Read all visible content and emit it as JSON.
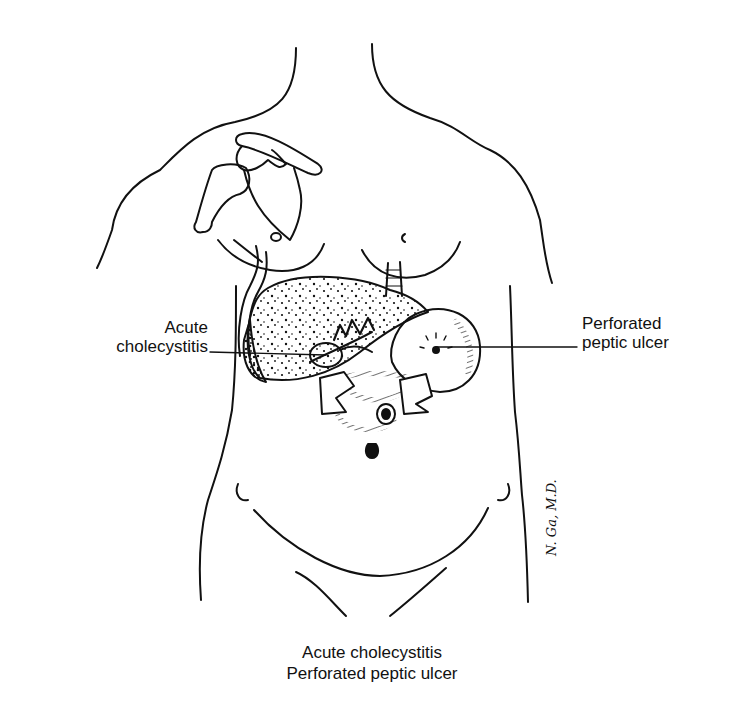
{
  "figure": {
    "stroke_color": "#111111",
    "background_color": "#ffffff",
    "organs": [
      "liver",
      "gallbladder",
      "stomach",
      "duodenum",
      "pancreas",
      "esophagus",
      "hepatic duct"
    ]
  },
  "labels": {
    "left": {
      "line1": "Acute",
      "line2": "cholecystitis",
      "points_to": "gallbladder"
    },
    "right": {
      "line1": "Perforated",
      "line2": "peptic ulcer",
      "points_to": "stomach ulcer site"
    }
  },
  "caption": {
    "line1": "Acute cholecystitis",
    "line2": "Perforated peptic ulcer"
  },
  "signature": {
    "text": "N. Ga, M.D."
  }
}
